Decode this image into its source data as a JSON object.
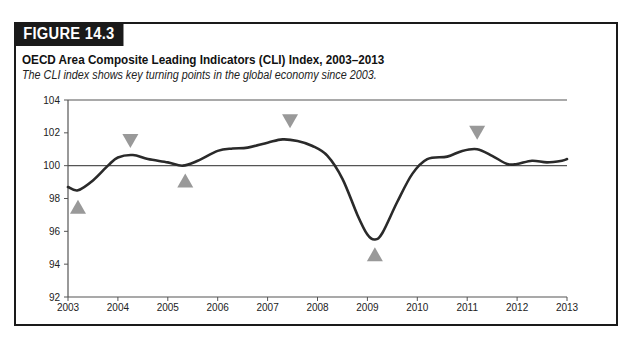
{
  "figure": {
    "label": "FIGURE 14.3",
    "title": "OECD Area Composite Leading Indicators (CLI) Index, 2003–2013",
    "subtitle": "The CLI index shows key turning points in the global economy since 2003."
  },
  "colors": {
    "frame": "#1a1a1a",
    "line": "#2a2a2a",
    "marker": "#999999",
    "gridline": "#555555"
  },
  "chart_data": {
    "type": "line",
    "title": "OECD Area Composite Leading Indicators (CLI) Index, 2003–2013",
    "subtitle": "The CLI index shows key turning points in the global economy since 2003.",
    "xlabel": "",
    "ylabel": "",
    "xlim": [
      2003,
      2013
    ],
    "ylim": [
      92,
      104
    ],
    "x_ticks": [
      "2003",
      "2004",
      "2005",
      "2006",
      "2007",
      "2008",
      "2009",
      "2010",
      "2011",
      "2012",
      "2013"
    ],
    "y_ticks": [
      "92",
      "94",
      "96",
      "98",
      "100",
      "102",
      "104"
    ],
    "gridlines": [
      100,
      104
    ],
    "legend": null,
    "series": [
      {
        "name": "CLI Index",
        "x": [
          2003.0,
          2003.2,
          2003.5,
          2003.8,
          2004.0,
          2004.3,
          2004.6,
          2005.0,
          2005.3,
          2005.6,
          2006.0,
          2006.3,
          2006.6,
          2007.0,
          2007.3,
          2007.6,
          2007.9,
          2008.2,
          2008.5,
          2008.8,
          2009.0,
          2009.15,
          2009.3,
          2009.6,
          2009.9,
          2010.2,
          2010.6,
          2010.9,
          2011.2,
          2011.5,
          2011.8,
          2012.0,
          2012.3,
          2012.6,
          2012.9,
          2013.0
        ],
        "y": [
          98.7,
          98.5,
          99.1,
          100.0,
          100.5,
          100.65,
          100.4,
          100.2,
          100.0,
          100.3,
          100.9,
          101.05,
          101.1,
          101.4,
          101.6,
          101.5,
          101.2,
          100.6,
          99.2,
          97.0,
          95.8,
          95.5,
          95.9,
          97.8,
          99.5,
          100.4,
          100.55,
          100.9,
          101.0,
          100.6,
          100.1,
          100.1,
          100.3,
          100.2,
          100.3,
          100.4
        ]
      }
    ],
    "annotations": [
      {
        "type": "trough-marker",
        "symbol": "triangle-up",
        "x": 2003.2,
        "y": 97.5
      },
      {
        "type": "peak-marker",
        "symbol": "triangle-down",
        "x": 2004.25,
        "y": 101.5
      },
      {
        "type": "trough-marker",
        "symbol": "triangle-up",
        "x": 2005.35,
        "y": 99.1
      },
      {
        "type": "peak-marker",
        "symbol": "triangle-down",
        "x": 2007.45,
        "y": 102.7
      },
      {
        "type": "trough-marker",
        "symbol": "triangle-up",
        "x": 2009.15,
        "y": 94.6
      },
      {
        "type": "peak-marker",
        "symbol": "triangle-down",
        "x": 2011.2,
        "y": 102.0
      }
    ]
  }
}
